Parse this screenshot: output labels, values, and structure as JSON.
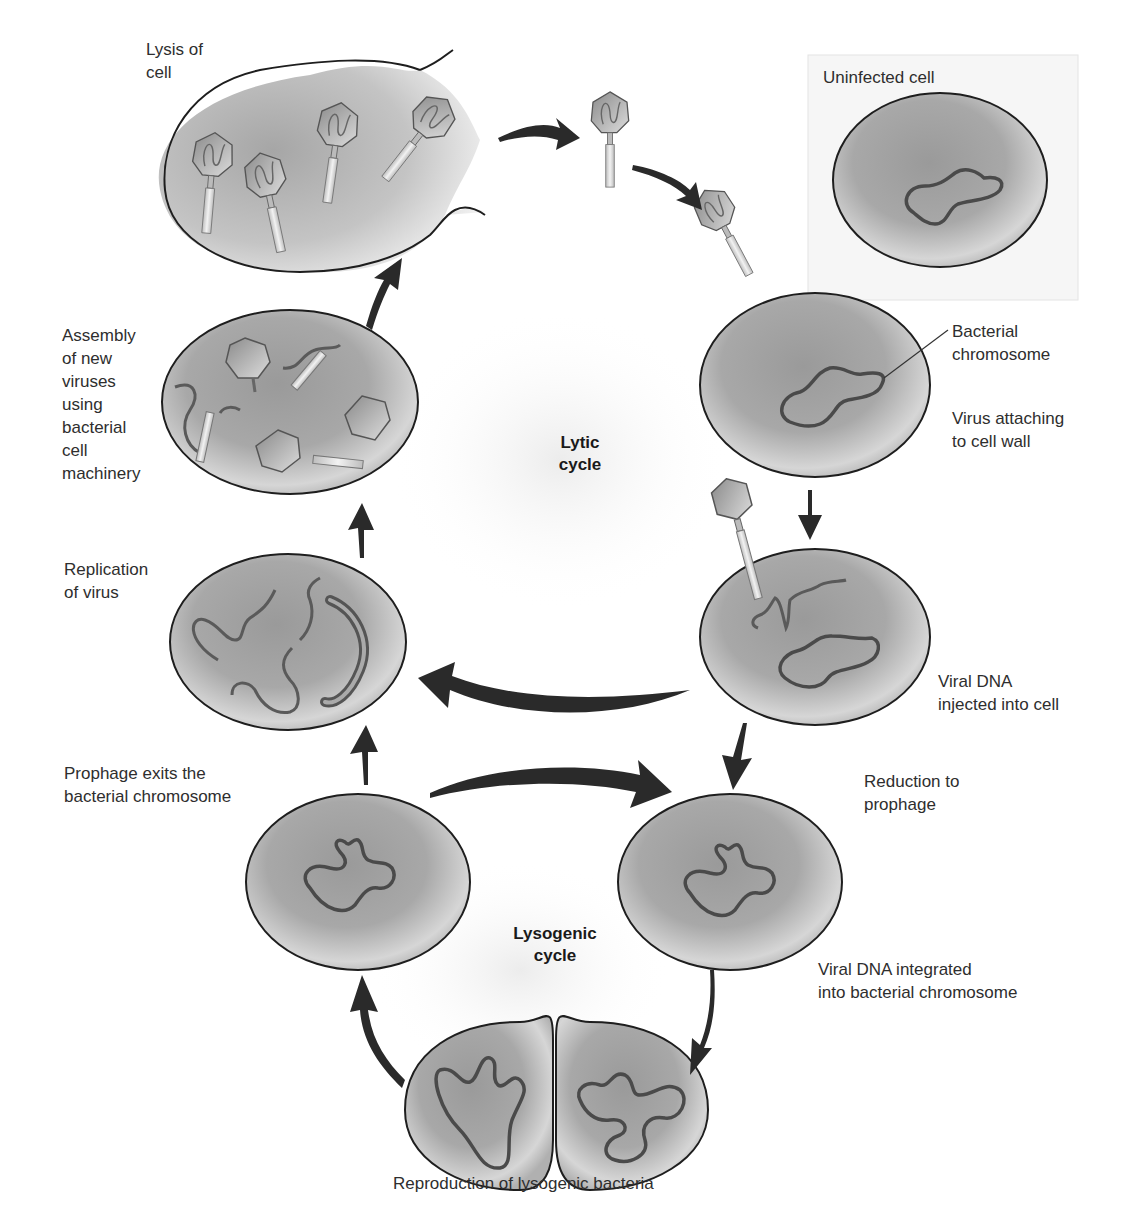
{
  "diagram": {
    "title_lytic": "Lytic\ncycle",
    "title_lysogenic": "Lysogenic\ncycle",
    "colors": {
      "cell_fill_light": "#d8d8d8",
      "cell_fill_dark": "#8c8c8c",
      "outline": "#1e1e1e",
      "arrow": "#2a2a2a",
      "background": "#ffffff",
      "box_bg": "#f6f6f6"
    },
    "labels": {
      "lysis": "Lysis of\ncell",
      "uninfected": "Uninfected cell",
      "bacterial_chromosome": "Bacterial\nchromosome",
      "attaching": "Virus attaching\nto cell wall",
      "injected": "Viral DNA\ninjected into cell",
      "reduction": "Reduction to\nprophage",
      "integrated": "Viral DNA integrated\ninto bacterial chromosome",
      "reproduction": "Reproduction of lysogenic bacteria",
      "prophage_exits": "Prophage exits the\nbacterial chromosome",
      "replication": "Replication\nof virus",
      "assembly": "Assembly\nof new\nviruses\nusing\nbacterial\ncell\nmachinery"
    },
    "stages": [
      {
        "id": "lysis",
        "cycle": "lytic"
      },
      {
        "id": "free-virus",
        "cycle": "lytic"
      },
      {
        "id": "attaching",
        "cycle": "lytic"
      },
      {
        "id": "injected",
        "cycle": "lytic/lysogenic branch"
      },
      {
        "id": "replication",
        "cycle": "lytic"
      },
      {
        "id": "assembly",
        "cycle": "lytic"
      },
      {
        "id": "reduction-to-prophage",
        "cycle": "lysogenic"
      },
      {
        "id": "reproduction",
        "cycle": "lysogenic"
      },
      {
        "id": "prophage-exits",
        "cycle": "lysogenic"
      }
    ]
  }
}
